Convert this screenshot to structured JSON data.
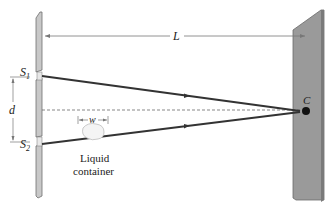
{
  "figure": {
    "labels": {
      "distance_L": "L",
      "slit_separation": "d",
      "container_width": "w",
      "slit1_main": "S",
      "slit1_sub": "1",
      "slit2_main": "S",
      "slit2_sub": "2",
      "screen_point": "C",
      "container_line1": "Liquid",
      "container_line2": "container"
    },
    "colors": {
      "barrier_fill": "#c8c8c8",
      "barrier_edge": "#6e6e6e",
      "screen_fill": "#9a9a9a",
      "screen_edge": "#6a6a6a",
      "ray": "#333333",
      "point": "#111111",
      "dashed_axis": "#555555"
    }
  }
}
